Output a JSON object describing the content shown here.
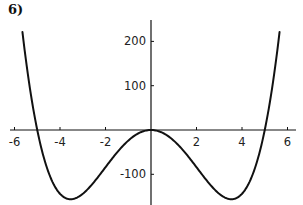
{
  "panel_label": "6)",
  "chart_data": {
    "type": "line",
    "title": "",
    "panel_label": "6)",
    "xlabel": "",
    "ylabel": "",
    "function": "y = x^4 - 25x^2",
    "xlim": [
      -6.2,
      6.2
    ],
    "ylim": [
      -165,
      250
    ],
    "grid": false,
    "legend": null,
    "x_ticks": [
      -6,
      -4,
      -2,
      2,
      4,
      6
    ],
    "x_tick_labels": [
      "-6",
      "-4",
      "-2",
      "2",
      "4",
      "6"
    ],
    "y_ticks": [
      200,
      100,
      -100
    ],
    "y_tick_labels": [
      "200",
      "100",
      "-100"
    ],
    "series": [
      {
        "name": "f(x)",
        "x": [
          -5.65,
          -5.5,
          -5.25,
          -5.0,
          -4.5,
          -4.0,
          -3.5,
          -3.0,
          -2.5,
          -2.0,
          -1.5,
          -1.0,
          -0.5,
          0.0,
          0.5,
          1.0,
          1.5,
          2.0,
          2.5,
          3.0,
          3.5,
          4.0,
          4.5,
          5.0,
          5.25,
          5.5,
          5.65
        ],
        "y": [
          220.9,
          158.8,
          70.6,
          0.0,
          -96.2,
          -144.0,
          -156.2,
          -144.0,
          -117.2,
          -84.0,
          -51.2,
          -24.0,
          -6.2,
          0.0,
          -6.2,
          -24.0,
          -51.2,
          -84.0,
          -117.2,
          -144.0,
          -156.2,
          -144.0,
          -96.2,
          0.0,
          70.6,
          158.8,
          220.9
        ]
      }
    ],
    "roots": [
      -5,
      0,
      5
    ],
    "minima": [
      [
        -3.54,
        -156.25
      ],
      [
        3.54,
        -156.25
      ]
    ],
    "colors": {
      "curve": "#111111",
      "axes": "#111111",
      "background": "#ffffff"
    }
  }
}
